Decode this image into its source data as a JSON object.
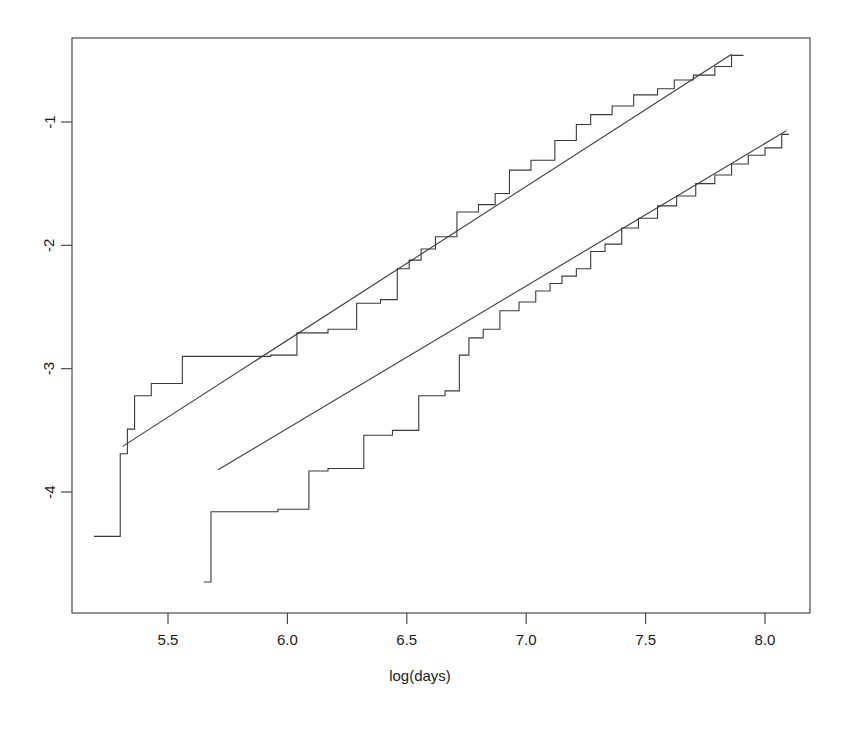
{
  "chart_data": {
    "type": "line",
    "title": "",
    "subtitle": "",
    "xlabel": "log(days)",
    "ylabel": "",
    "xlim": [
      5.19,
      8.15
    ],
    "ylim": [
      -4.7,
      -0.36
    ],
    "grid": false,
    "legend": null,
    "xticks": [
      "5.5",
      "6.0",
      "6.5",
      "7.0",
      "7.5",
      "8.0"
    ],
    "xtick_values": [
      5.5,
      6.0,
      6.5,
      7.0,
      7.5,
      8.0
    ],
    "yticks": [
      "-1",
      "-2",
      "-3",
      "-4"
    ],
    "ytick_values": [
      -1,
      -2,
      -3,
      -4
    ],
    "line_color": "#3a3a3a",
    "frame_color": "#4a4a4a",
    "background": "#ffffff",
    "series": [
      {
        "name": "upper-step-curve",
        "type": "step",
        "drawstyle": "steps-post",
        "x": [
          5.19,
          5.3,
          5.3,
          5.33,
          5.33,
          5.36,
          5.36,
          5.43,
          5.43,
          5.56,
          5.56,
          5.93,
          5.93,
          6.04,
          6.04,
          6.17,
          6.17,
          6.29,
          6.29,
          6.39,
          6.39,
          6.46,
          6.46,
          6.51,
          6.51,
          6.56,
          6.56,
          6.62,
          6.62,
          6.71,
          6.71,
          6.8,
          6.8,
          6.87,
          6.87,
          6.93,
          6.93,
          7.02,
          7.02,
          7.12,
          7.12,
          7.21,
          7.21,
          7.27,
          7.27,
          7.36,
          7.36,
          7.45,
          7.45,
          7.55,
          7.55,
          7.62,
          7.62,
          7.7,
          7.7,
          7.79,
          7.79,
          7.86,
          7.86,
          7.91
        ],
        "y": [
          -4.36,
          -4.36,
          -3.69,
          -3.69,
          -3.49,
          -3.49,
          -3.22,
          -3.22,
          -3.12,
          -3.12,
          -2.9,
          -2.9,
          -2.89,
          -2.89,
          -2.71,
          -2.71,
          -2.68,
          -2.68,
          -2.47,
          -2.47,
          -2.44,
          -2.44,
          -2.19,
          -2.19,
          -2.12,
          -2.12,
          -2.03,
          -2.03,
          -1.93,
          -1.93,
          -1.73,
          -1.73,
          -1.67,
          -1.67,
          -1.58,
          -1.58,
          -1.39,
          -1.39,
          -1.31,
          -1.31,
          -1.15,
          -1.15,
          -1.02,
          -1.02,
          -0.94,
          -0.94,
          -0.87,
          -0.87,
          -0.78,
          -0.78,
          -0.73,
          -0.73,
          -0.66,
          -0.66,
          -0.62,
          -0.62,
          -0.55,
          -0.55,
          -0.46,
          -0.46
        ]
      },
      {
        "name": "lower-step-curve",
        "type": "step",
        "drawstyle": "steps-post",
        "x": [
          5.65,
          5.68,
          5.68,
          5.96,
          5.96,
          6.09,
          6.09,
          6.17,
          6.17,
          6.32,
          6.32,
          6.44,
          6.44,
          6.55,
          6.55,
          6.66,
          6.66,
          6.72,
          6.72,
          6.76,
          6.76,
          6.82,
          6.82,
          6.89,
          6.89,
          6.97,
          6.97,
          7.04,
          7.04,
          7.1,
          7.1,
          7.15,
          7.15,
          7.21,
          7.21,
          7.27,
          7.27,
          7.33,
          7.33,
          7.4,
          7.4,
          7.47,
          7.47,
          7.55,
          7.55,
          7.63,
          7.63,
          7.71,
          7.71,
          7.79,
          7.79,
          7.86,
          7.86,
          7.93,
          7.93,
          8.0,
          8.0,
          8.07,
          8.07,
          8.1
        ],
        "y": [
          -4.73,
          -4.73,
          -4.16,
          -4.16,
          -4.14,
          -4.14,
          -3.83,
          -3.83,
          -3.81,
          -3.81,
          -3.54,
          -3.54,
          -3.5,
          -3.5,
          -3.22,
          -3.22,
          -3.18,
          -3.18,
          -2.89,
          -2.89,
          -2.75,
          -2.75,
          -2.68,
          -2.68,
          -2.53,
          -2.53,
          -2.46,
          -2.46,
          -2.37,
          -2.37,
          -2.31,
          -2.31,
          -2.25,
          -2.25,
          -2.19,
          -2.19,
          -2.05,
          -2.05,
          -1.99,
          -1.99,
          -1.86,
          -1.86,
          -1.78,
          -1.78,
          -1.68,
          -1.68,
          -1.6,
          -1.6,
          -1.5,
          -1.5,
          -1.43,
          -1.43,
          -1.34,
          -1.34,
          -1.27,
          -1.27,
          -1.21,
          -1.21,
          -1.1,
          -1.1
        ]
      },
      {
        "name": "upper-regression-line",
        "type": "line",
        "x": [
          5.31,
          7.86
        ],
        "y": [
          -3.63,
          -0.45
        ]
      },
      {
        "name": "lower-regression-line",
        "type": "line",
        "x": [
          5.71,
          8.09
        ],
        "y": [
          -3.82,
          -1.07
        ]
      }
    ]
  },
  "figure": {
    "xlabel": "log(days)"
  }
}
